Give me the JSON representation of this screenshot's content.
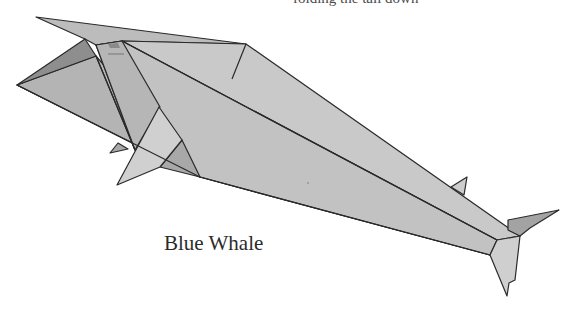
{
  "figure": {
    "top_caption_partial": "folding the tail down",
    "label": "Blue Whale",
    "colors": {
      "body_light": "#c6c6c6",
      "body_mid": "#b4b4b4",
      "body_dark": "#8e8e8e",
      "flipper": "#cfcfcf",
      "fluke_dark": "#a3a3a3",
      "outline": "#2a2a2a",
      "background": "#ffffff"
    }
  }
}
